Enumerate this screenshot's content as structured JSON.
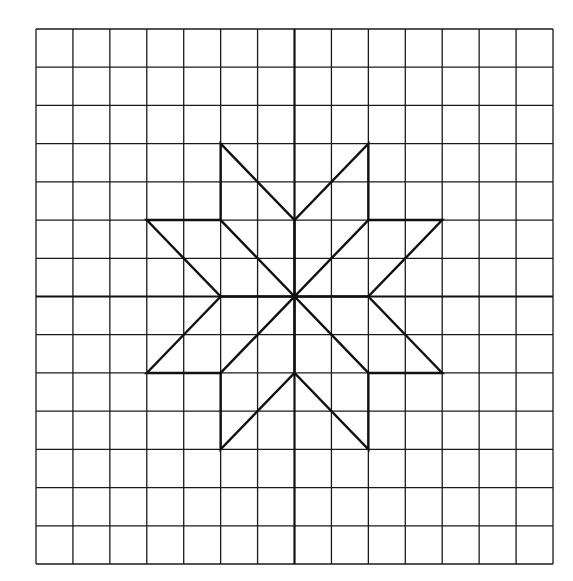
{
  "figure": {
    "type": "coordinate-grid-diagram",
    "grid": {
      "columns": 14,
      "rows": 14,
      "left": 36,
      "top": 29,
      "right": 553,
      "bottom": 564,
      "line_color": "#1a1a1a"
    },
    "axes": {
      "origin_col": 7,
      "origin_row": 7,
      "color": "#111111"
    },
    "shape": {
      "name": "eight-pointed-star",
      "color": "#111111",
      "outline_points": [
        [
          -2,
          4
        ],
        [
          0,
          2
        ],
        [
          2,
          4
        ],
        [
          2,
          2
        ],
        [
          4,
          2
        ],
        [
          2,
          0
        ],
        [
          4,
          -2
        ],
        [
          2,
          -2
        ],
        [
          2,
          -4
        ],
        [
          0,
          -2
        ],
        [
          -2,
          -4
        ],
        [
          -2,
          -2
        ],
        [
          -4,
          -2
        ],
        [
          -2,
          0
        ],
        [
          -4,
          2
        ],
        [
          -2,
          2
        ]
      ],
      "inner_segments": [
        [
          [
            -2,
            2
          ],
          [
            2,
            -2
          ]
        ],
        [
          [
            2,
            2
          ],
          [
            -2,
            -2
          ]
        ],
        [
          [
            0,
            2
          ],
          [
            0,
            -2
          ]
        ],
        [
          [
            -2,
            0
          ],
          [
            2,
            0
          ]
        ]
      ]
    }
  }
}
